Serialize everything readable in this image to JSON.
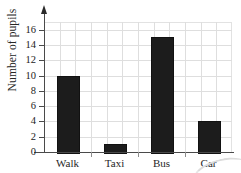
{
  "chart_data": {
    "type": "bar",
    "title": "",
    "xlabel": "",
    "ylabel": "Number of pupils",
    "categories": [
      "Walk",
      "Taxi",
      "Bus",
      "Car"
    ],
    "values": [
      10,
      1,
      15,
      4
    ],
    "ylim": [
      0,
      17
    ],
    "ytick_values": [
      0,
      2,
      4,
      6,
      8,
      10,
      12,
      14,
      16
    ],
    "ytick_labels": [
      "0",
      "2",
      "4",
      "6",
      "8",
      "10",
      "12",
      "14",
      "16"
    ],
    "grid": "both",
    "legend": "none",
    "bar_color": "#1c1c1c",
    "axis_color": "#4a4a4a",
    "grid_color": "#dedede",
    "series": [
      {
        "name": "Number of pupils",
        "values": [
          10,
          1,
          15,
          4
        ]
      }
    ]
  },
  "axis": {
    "y_title": "Number of pupils",
    "y_arrow": "arrow-up-icon"
  },
  "ticks": {
    "y": [
      {
        "label": "16",
        "value": 16
      },
      {
        "label": "14",
        "value": 14
      },
      {
        "label": "12",
        "value": 12
      },
      {
        "label": "10",
        "value": 10
      },
      {
        "label": "8",
        "value": 8
      },
      {
        "label": "6",
        "value": 6
      },
      {
        "label": "4",
        "value": 4
      },
      {
        "label": "2",
        "value": 2
      },
      {
        "label": "0",
        "value": 0
      }
    ]
  },
  "bars": [
    {
      "label": "Walk",
      "value": 10
    },
    {
      "label": "Taxi",
      "value": 1
    },
    {
      "label": "Bus",
      "value": 15
    },
    {
      "label": "Car",
      "value": 4
    }
  ]
}
